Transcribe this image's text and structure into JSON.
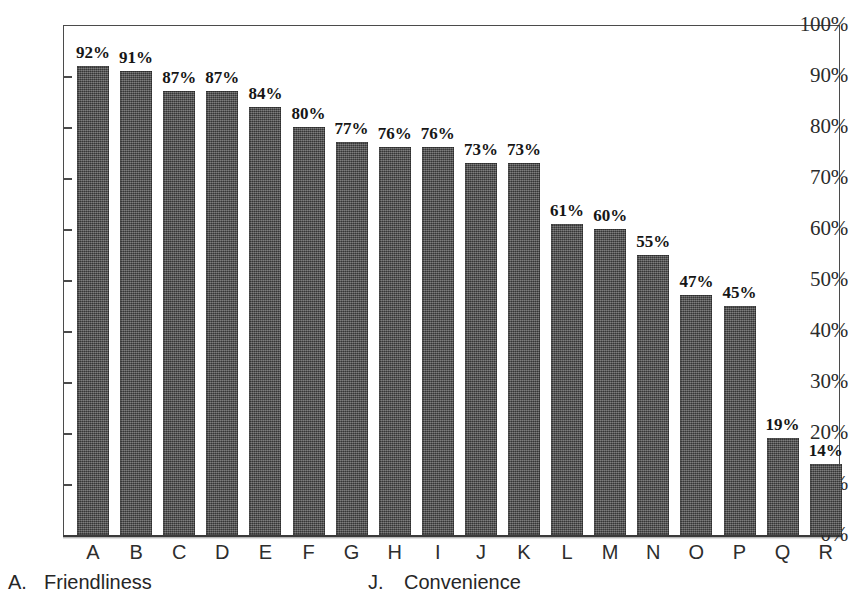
{
  "chart_data": {
    "type": "bar",
    "title": "",
    "subtitle": "",
    "xlabel": "",
    "ylabel": "",
    "ylim": [
      0,
      100
    ],
    "grid": false,
    "legend_position": "below-axis",
    "categories": [
      "A",
      "B",
      "C",
      "D",
      "E",
      "F",
      "G",
      "H",
      "I",
      "J",
      "K",
      "L",
      "M",
      "N",
      "O",
      "P",
      "Q",
      "R"
    ],
    "values": [
      92,
      91,
      87,
      87,
      84,
      80,
      77,
      76,
      76,
      73,
      73,
      61,
      60,
      55,
      47,
      45,
      19,
      14
    ],
    "value_labels": [
      "92%",
      "91%",
      "87%",
      "87%",
      "84%",
      "80%",
      "77%",
      "76%",
      "76%",
      "73%",
      "73%",
      "61%",
      "60%",
      "55%",
      "47%",
      "45%",
      "19%",
      "14%"
    ],
    "y_ticks": [
      0,
      10,
      20,
      30,
      40,
      50,
      60,
      70,
      80,
      90,
      100
    ],
    "y_tick_labels": [
      "0%",
      "10%",
      "20%",
      "30%",
      "40%",
      "50%",
      "60%",
      "70%",
      "80%",
      "90%",
      "100%"
    ],
    "bar_color": "#4e4e4e",
    "axis_color": "#4b4b4b",
    "text_color": "#1c1c1c"
  },
  "legend": {
    "entries": [
      {
        "key": "A.",
        "label": "Friendliness"
      },
      {
        "key": "J.",
        "label": "Convenience"
      }
    ]
  }
}
